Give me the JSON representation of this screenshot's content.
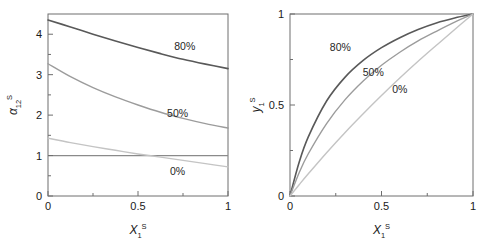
{
  "chart_data": [
    {
      "panel": "left",
      "type": "line",
      "title": "",
      "xlabel": "X₁ˢ",
      "ylabel": "α₁₂ˢ",
      "xlabel_parts": {
        "base": "X",
        "sub": "1",
        "sup": "S"
      },
      "ylabel_parts": {
        "base": "α",
        "sub": "12",
        "sup": "S"
      },
      "xlim": [
        0,
        1
      ],
      "ylim": [
        0,
        4.5
      ],
      "xticks": [
        0,
        0.5,
        1
      ],
      "xticklabels": [
        "0",
        "0.5",
        "1"
      ],
      "xminorticks": [
        0.25,
        0.75
      ],
      "yticks": [
        0,
        1,
        2,
        3,
        4
      ],
      "yticklabels": [
        "0",
        "1",
        "2",
        "3",
        "4"
      ],
      "yminorticks": [
        0.5,
        1.5,
        2.5,
        3.5
      ],
      "grid": false,
      "legend_position": "inline-annotations",
      "reference_line": {
        "name": "alpha-equals-one",
        "y": 1.0,
        "color": "#8a8a8a"
      },
      "series": [
        {
          "name": "80%",
          "label": "80%",
          "color": "#595959",
          "width": 1.6,
          "x": [
            0,
            0.125,
            0.25,
            0.375,
            0.5,
            0.625,
            0.75,
            0.875,
            1
          ],
          "values": [
            4.35,
            4.18,
            4.0,
            3.83,
            3.67,
            3.52,
            3.38,
            3.26,
            3.15
          ]
        },
        {
          "name": "50%",
          "label": "50%",
          "color": "#9c9c9c",
          "width": 1.4,
          "x": [
            0,
            0.125,
            0.25,
            0.375,
            0.5,
            0.625,
            0.75,
            0.875,
            1
          ],
          "values": [
            3.27,
            2.95,
            2.68,
            2.45,
            2.25,
            2.07,
            1.92,
            1.79,
            1.68
          ]
        },
        {
          "name": "0%",
          "label": "0%",
          "color": "#c4c4c4",
          "width": 1.4,
          "x": [
            0,
            0.125,
            0.25,
            0.375,
            0.5,
            0.625,
            0.75,
            0.875,
            1
          ],
          "values": [
            1.43,
            1.32,
            1.22,
            1.13,
            1.04,
            0.96,
            0.88,
            0.8,
            0.72
          ]
        }
      ],
      "annotations": [
        {
          "text": "80%",
          "x": 0.76,
          "y": 3.62,
          "for": "80%"
        },
        {
          "text": "50%",
          "x": 0.72,
          "y": 1.95,
          "for": "50%"
        },
        {
          "text": "0%",
          "x": 0.72,
          "y": 0.52,
          "for": "0%"
        }
      ]
    },
    {
      "panel": "right",
      "type": "line",
      "title": "",
      "xlabel": "X₁ˢ",
      "ylabel": "y₁ˢ",
      "xlabel_parts": {
        "base": "X",
        "sub": "1",
        "sup": "S"
      },
      "ylabel_parts": {
        "base": "y",
        "sub": "1",
        "sup": "S"
      },
      "xlim": [
        0,
        1
      ],
      "ylim": [
        0,
        1
      ],
      "xticks": [
        0,
        0.5,
        1
      ],
      "xticklabels": [
        "0",
        "0.5",
        "1"
      ],
      "xminorticks": [
        0.25,
        0.75
      ],
      "yticks": [
        0,
        0.5,
        1
      ],
      "yticklabels": [
        "0",
        "0.5",
        "1"
      ],
      "yminorticks": [
        0.25,
        0.75
      ],
      "grid": false,
      "legend_position": "inline-annotations",
      "series": [
        {
          "name": "80%",
          "label": "80%",
          "color": "#595959",
          "width": 1.6,
          "x": [
            0,
            0.05,
            0.1,
            0.2,
            0.3,
            0.4,
            0.5,
            0.6,
            0.7,
            0.8,
            0.9,
            1
          ],
          "values": [
            0,
            0.185,
            0.325,
            0.522,
            0.652,
            0.745,
            0.815,
            0.87,
            0.915,
            0.951,
            0.978,
            1
          ]
        },
        {
          "name": "50%",
          "label": "50%",
          "color": "#9c9c9c",
          "width": 1.4,
          "x": [
            0,
            0.05,
            0.1,
            0.2,
            0.3,
            0.4,
            0.5,
            0.6,
            0.7,
            0.8,
            0.9,
            1
          ],
          "values": [
            0,
            0.128,
            0.232,
            0.398,
            0.528,
            0.632,
            0.718,
            0.79,
            0.852,
            0.905,
            0.955,
            1
          ]
        },
        {
          "name": "0%",
          "label": "0%",
          "color": "#c4c4c4",
          "width": 1.4,
          "x": [
            0,
            0.05,
            0.1,
            0.2,
            0.3,
            0.4,
            0.5,
            0.6,
            0.7,
            0.8,
            0.9,
            1
          ],
          "values": [
            0,
            0.062,
            0.122,
            0.238,
            0.348,
            0.452,
            0.552,
            0.648,
            0.74,
            0.828,
            0.915,
            1
          ]
        }
      ],
      "annotations": [
        {
          "text": "80%",
          "x": 0.275,
          "y": 0.795,
          "for": "80%"
        },
        {
          "text": "50%",
          "x": 0.455,
          "y": 0.66,
          "for": "50%"
        },
        {
          "text": "0%",
          "x": 0.6,
          "y": 0.565,
          "for": "0%"
        }
      ]
    }
  ],
  "colors": {
    "axis": "#6e6e6e",
    "text": "#1a1a1a",
    "background": "#ffffff",
    "series_80": "#595959",
    "series_50": "#9c9c9c",
    "series_0": "#c4c4c4"
  }
}
